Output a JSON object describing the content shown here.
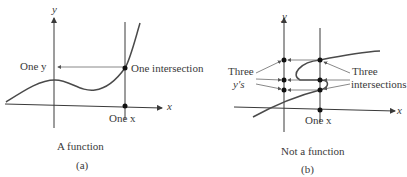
{
  "panel_a": {
    "axis_y": "y",
    "axis_x": "x",
    "one_y": "One y",
    "one_intersection": "One intersection",
    "one_x": "One x",
    "caption": "A function",
    "tag": "(a)"
  },
  "panel_b": {
    "axis_y": "y",
    "axis_x": "x",
    "three": "Three",
    "ys": "y's",
    "three_right": "Three",
    "intersections": "intersections",
    "one_x": "One x",
    "caption": "Not a function",
    "tag": "(b)"
  },
  "colors": {
    "curve": "#4a4a4a",
    "axis": "#3a3a3a",
    "arrow": "#6a6a6a"
  }
}
